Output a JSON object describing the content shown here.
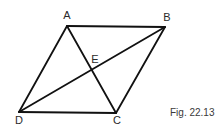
{
  "diagram": {
    "caption": "Fig. 22.13",
    "points": {
      "A": {
        "label": "A",
        "x": 67,
        "y": 26,
        "lx": 67,
        "ly": 19
      },
      "B": {
        "label": "B",
        "x": 165,
        "y": 27,
        "lx": 167,
        "ly": 21
      },
      "C": {
        "label": "C",
        "x": 116,
        "y": 113,
        "lx": 117,
        "ly": 124
      },
      "D": {
        "label": "D",
        "x": 19,
        "y": 112,
        "lx": 19,
        "ly": 124
      },
      "E": {
        "label": "E",
        "x": 92,
        "y": 70,
        "lx": 95,
        "ly": 63
      }
    },
    "segments": [
      {
        "name": "side-AB",
        "from": "A",
        "to": "B"
      },
      {
        "name": "side-BC",
        "from": "B",
        "to": "C"
      },
      {
        "name": "side-CD",
        "from": "C",
        "to": "D"
      },
      {
        "name": "side-DA",
        "from": "D",
        "to": "A"
      },
      {
        "name": "diagonal-AC",
        "from": "A",
        "to": "C"
      },
      {
        "name": "diagonal-BD",
        "from": "B",
        "to": "D"
      }
    ],
    "stroke_color": "#111111",
    "background": "#ffffff"
  }
}
